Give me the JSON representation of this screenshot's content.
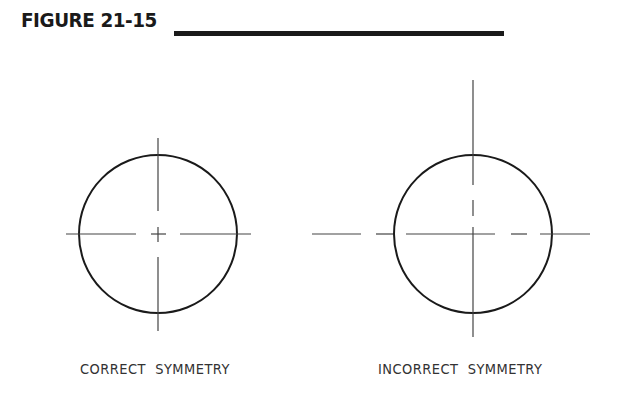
{
  "figure": {
    "title": "FIGURE 21-15"
  },
  "panels": [
    {
      "id": "correct",
      "caption": "CORRECT  SYMMETRY",
      "circle": {
        "cx": 158,
        "cy": 234,
        "r": 79
      },
      "centerline_style": "centered long-short-long dash with center cross"
    },
    {
      "id": "incorrect",
      "caption": "INCORRECT  SYMMETRY",
      "circle": {
        "cx": 473,
        "cy": 234,
        "r": 79
      },
      "centerline_style": "offset dashes, not centered on circle"
    }
  ],
  "colors": {
    "ink": "#1a1a1a",
    "line": "#444444",
    "background": "#ffffff"
  }
}
